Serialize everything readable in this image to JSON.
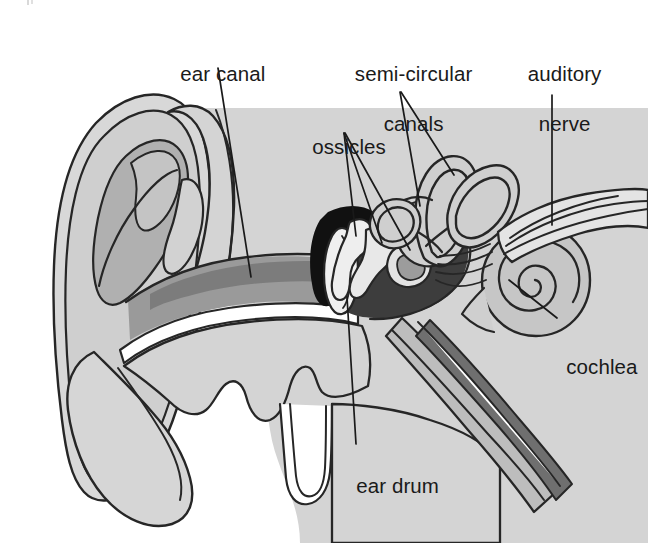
{
  "diagram": {
    "background_color": "#ffffff",
    "line_color": "#1a1a1a",
    "text_color": "#1a1a1a"
  },
  "palette": {
    "outline": "#262626",
    "pinna_light": "#d8d8d8",
    "pinna_mid": "#bdbdbd",
    "concha_dark": "#a8a8a8",
    "canal_gray": "#9a9a9a",
    "canal_dark": "#7e7e7e",
    "middle_ear_dark": "#3a3a3a",
    "bone_black": "#111111",
    "ossicle_light": "#ededed",
    "cochlea_fill": "#c6c6c6",
    "nerve_fill": "#e2e2e2",
    "tube_mid": "#b5b5b5",
    "tube_dark": "#6d6d6d",
    "white": "#ffffff"
  },
  "labels": [
    {
      "id": "ear-canal",
      "text": "ear canal",
      "lines": [
        "ear canal"
      ]
    },
    {
      "id": "semi-circular-canals",
      "text": "semi-circular canals",
      "lines": [
        "semi-circular",
        "canals"
      ]
    },
    {
      "id": "auditory-nerve",
      "text": "auditory nerve",
      "lines": [
        "auditory",
        "nerve"
      ]
    },
    {
      "id": "ossicles",
      "text": "ossicles",
      "lines": [
        "ossicles"
      ]
    },
    {
      "id": "cochlea",
      "text": "cochlea",
      "lines": [
        "cochlea"
      ]
    },
    {
      "id": "ear-drum",
      "text": "ear drum",
      "lines": [
        "ear drum"
      ]
    }
  ],
  "label_text": {
    "ear_canal": "ear canal",
    "semi_circular_1": "semi-circular",
    "semi_circular_2": "canals",
    "auditory_1": "auditory",
    "auditory_2": "nerve",
    "ossicles": "ossicles",
    "cochlea": "cochlea",
    "ear_drum": "ear drum"
  },
  "parts": [
    {
      "name": "pinna",
      "label": "outer ear (pinna)"
    },
    {
      "name": "ear-canal",
      "label": "ear canal"
    },
    {
      "name": "ear-drum",
      "label": "ear drum"
    },
    {
      "name": "ossicles",
      "label": "ossicles"
    },
    {
      "name": "semi-circular-canals",
      "label": "semi-circular canals"
    },
    {
      "name": "cochlea",
      "label": "cochlea"
    },
    {
      "name": "auditory-nerve",
      "label": "auditory nerve"
    },
    {
      "name": "eustachian-tube",
      "label": "eustachian tube"
    }
  ]
}
